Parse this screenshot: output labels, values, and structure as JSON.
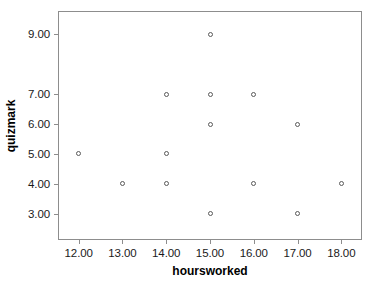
{
  "chart_data": {
    "type": "scatter",
    "title": "",
    "xlabel": "hoursworked",
    "ylabel": "quizmark",
    "xlim": [
      11.55,
      18.45
    ],
    "ylim": [
      2.15,
      9.75
    ],
    "grid": false,
    "legend": null,
    "marker": "open-circle",
    "xticks": [
      12,
      13,
      14,
      15,
      16,
      17,
      18
    ],
    "xticklabels": [
      "12.00",
      "13.00",
      "14.00",
      "15.00",
      "16.00",
      "17.00",
      "18.00"
    ],
    "yticks": [
      3,
      4,
      5,
      6,
      7,
      9
    ],
    "yticklabels": [
      "3.00",
      "4.00",
      "5.00",
      "6.00",
      "7.00",
      "9.00"
    ],
    "points": [
      {
        "x": 12,
        "y": 5
      },
      {
        "x": 13,
        "y": 4
      },
      {
        "x": 14,
        "y": 7
      },
      {
        "x": 14,
        "y": 5
      },
      {
        "x": 14,
        "y": 4
      },
      {
        "x": 15,
        "y": 9
      },
      {
        "x": 15,
        "y": 7
      },
      {
        "x": 15,
        "y": 6
      },
      {
        "x": 15,
        "y": 3
      },
      {
        "x": 16,
        "y": 7
      },
      {
        "x": 16,
        "y": 4
      },
      {
        "x": 17,
        "y": 6
      },
      {
        "x": 17,
        "y": 3
      },
      {
        "x": 18,
        "y": 4
      }
    ],
    "colors": {
      "marker_stroke": "#5a5a5a",
      "marker_fill": "#ffffff",
      "axis": "#8d8d8d",
      "text": "#1a1a1a",
      "background": "#ffffff"
    }
  }
}
